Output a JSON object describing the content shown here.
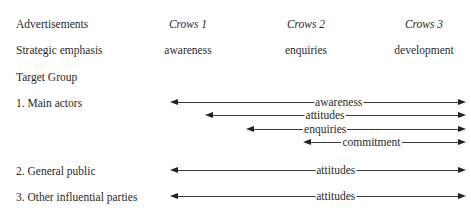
{
  "rows": {
    "advertisements": "Advertisements",
    "strategic_emphasis": "Strategic emphasis",
    "target_group": "Target Group"
  },
  "columns": [
    {
      "title": "Crows 1",
      "emphasis": "awareness"
    },
    {
      "title": "Crows 2",
      "emphasis": "enquiries"
    },
    {
      "title": "Crows 3",
      "emphasis": "development"
    }
  ],
  "groups": [
    {
      "label": "1.  Main actors",
      "arrows": [
        {
          "label": "awareness"
        },
        {
          "label": "attitudes"
        },
        {
          "label": "enquiries"
        },
        {
          "label": "commitment"
        }
      ]
    },
    {
      "label": "2.  General public",
      "arrows": [
        {
          "label": "attitudes"
        }
      ]
    },
    {
      "label": "3.  Other influential parties",
      "arrows": [
        {
          "label": "attitudes"
        }
      ]
    }
  ]
}
